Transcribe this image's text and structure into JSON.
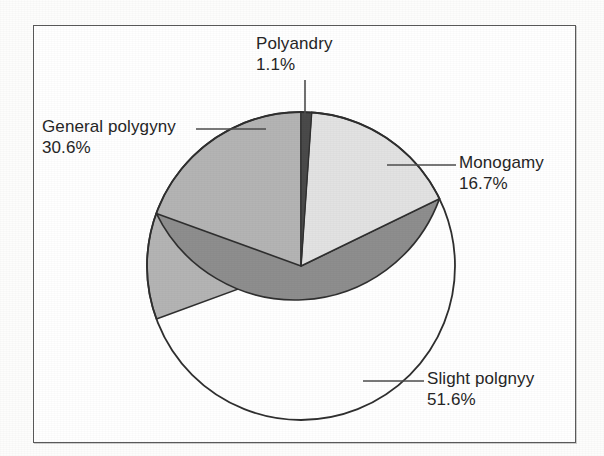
{
  "figure": {
    "background_color": "#ffffff",
    "frame_color": "#5a5a5a"
  },
  "chart_data": {
    "type": "pie",
    "title": "",
    "subtitle": "",
    "xlabel": "",
    "ylabel": "",
    "legend_position": "none",
    "grid": false,
    "units": "percent",
    "start_angle_deg": 0,
    "direction": "clockwise",
    "categories": [
      "Polyandry",
      "Monogamy",
      "Slight polgnyy",
      "General polygyny"
    ],
    "values": [
      1.1,
      16.7,
      51.6,
      30.6
    ],
    "slices": [
      {
        "label": "Polyandry",
        "value": 1.1,
        "value_text": "1.1%",
        "color": "#4a4a4a",
        "start_deg": 0.0,
        "end_deg": 3.96
      },
      {
        "label": "Monogamy",
        "value": 16.7,
        "value_text": "16.7%",
        "color": "#e2e2e2",
        "start_deg": 3.96,
        "end_deg": 64.08
      },
      {
        "label": "Slight polgnyy",
        "value": 51.6,
        "value_text": "51.6%",
        "color": "#8e8e8e",
        "start_deg": 64.08,
        "end_deg": 249.84
      },
      {
        "label": "General polygyny",
        "value": 30.6,
        "value_text": "30.6%",
        "color": "#b4b4b4",
        "start_deg": 249.84,
        "end_deg": 360.0
      }
    ]
  },
  "labels": {
    "polyandry": {
      "name": "Polyandry",
      "percent": "1.1%"
    },
    "general_polygyny": {
      "name": "General polygyny",
      "percent": "30.6%"
    },
    "monogamy": {
      "name": "Monogamy",
      "percent": "16.7%"
    },
    "slight_polygyny": {
      "name": "Slight polgnyy",
      "percent": "51.6%"
    }
  }
}
